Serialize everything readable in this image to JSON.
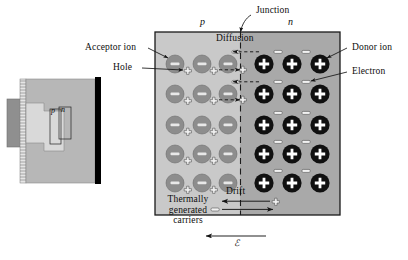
{
  "figure": {
    "title_absent": true,
    "labels": {
      "region_p": "p",
      "region_n": "n",
      "junction": "Junction",
      "diffusion": "Diffusion",
      "drift": "Drift",
      "acceptor_ion": "Acceptor ion",
      "hole": "Hole",
      "donor_ion": "Donor ion",
      "electron": "Electron",
      "thermally_generated_carriers": "Thermally generated carriers",
      "field_symbol": "ℰ",
      "inset_p": "p",
      "inset_n": "n"
    },
    "colors": {
      "p_region_fill": "#c9c9c9",
      "n_region_fill": "#a9a9a9",
      "acceptor_ion_fill": "#8d8d8d",
      "donor_ion_fill": "#101010",
      "outline": "#1a1a1a",
      "page_background": "#ffffff",
      "inset_body_fill": "#b5b5b5",
      "inset_contact_fill": "#8a8a8a",
      "inset_light_fill": "#d6d6d6",
      "inset_black_fill": "#000000"
    },
    "counts": {
      "acceptor_ion_rows": 5,
      "acceptor_ion_cols": 3,
      "donor_ion_rows": 5,
      "donor_ion_cols": 3,
      "hole_symbols": 13,
      "electron_symbols": 13,
      "diffusion_arrows": 4,
      "drift_arrows": 2
    }
  }
}
